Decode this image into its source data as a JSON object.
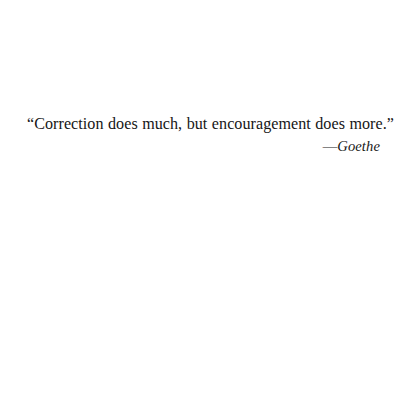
{
  "page": {
    "background_color": "#ffffff",
    "text_color": "#161616"
  },
  "quotation": {
    "text": "“Correction does much, but encouragement does more.”",
    "attribution_dash": "—",
    "attribution_name": "Goethe"
  }
}
